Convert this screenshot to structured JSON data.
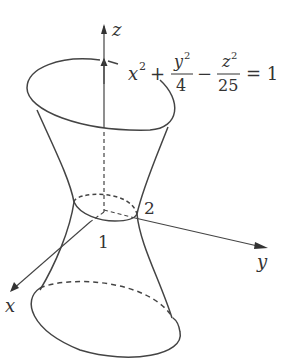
{
  "figure": {
    "axes": {
      "z": "z",
      "y": "y",
      "x": "x"
    },
    "equation": {
      "x_term": "x",
      "plus": "+",
      "y_num": "y",
      "y_den": "4",
      "minus": "−",
      "z_num": "z",
      "z_den": "25",
      "exp": "2",
      "equals": "= 1"
    },
    "waist_labels": {
      "x_intercept": "1",
      "y_intercept": "2"
    },
    "stroke_color": "#444444"
  }
}
